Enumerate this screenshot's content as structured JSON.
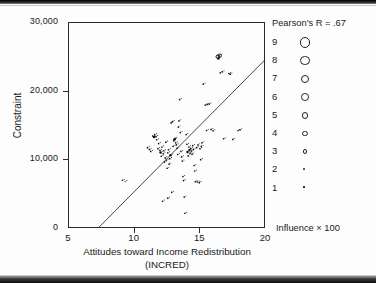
{
  "chart_data": {
    "type": "scatter",
    "title": "",
    "xlabel": "Attitudes toward Income Redistribution",
    "xlabel_line2": "(INCRED)",
    "ylabel": "Constraint",
    "xlim": [
      5,
      20
    ],
    "ylim": [
      0,
      30000
    ],
    "xticks": [
      5,
      10,
      15,
      20
    ],
    "xticklabels": [
      "5",
      "10",
      "15",
      "20"
    ],
    "yticks": [
      0,
      10000,
      20000,
      30000
    ],
    "yticklabels": [
      "0",
      "10,000",
      "20,000",
      "30,000"
    ],
    "grid": false,
    "annotation": "Pearson's R = .67",
    "correlation": 0.67,
    "legend_position": "right",
    "legend_title": "Influence × 100",
    "legend_entries": [
      {
        "label": "9",
        "size": 9
      },
      {
        "label": "8",
        "size": 8
      },
      {
        "label": "7",
        "size": 7
      },
      {
        "label": "6",
        "size": 6
      },
      {
        "label": "5",
        "size": 5
      },
      {
        "label": "4",
        "size": 4
      },
      {
        "label": "3",
        "size": 3
      },
      {
        "label": "2",
        "size": 2
      },
      {
        "label": "1",
        "size": 1
      }
    ],
    "regression_line": {
      "x": [
        7.3,
        20.0
      ],
      "y": [
        0,
        24500
      ]
    },
    "bubble_size_variable": "Influence × 100",
    "points": [
      {
        "x": 9.15,
        "y": 6950,
        "s": 2
      },
      {
        "x": 9.35,
        "y": 6750,
        "s": 1
      },
      {
        "x": 11.05,
        "y": 11700,
        "s": 2
      },
      {
        "x": 11.2,
        "y": 11450,
        "s": 2
      },
      {
        "x": 11.3,
        "y": 11150,
        "s": 2
      },
      {
        "x": 11.45,
        "y": 13400,
        "s": 2
      },
      {
        "x": 11.55,
        "y": 13250,
        "s": 3
      },
      {
        "x": 11.6,
        "y": 13600,
        "s": 2
      },
      {
        "x": 11.7,
        "y": 13300,
        "s": 2
      },
      {
        "x": 11.75,
        "y": 12850,
        "s": 2
      },
      {
        "x": 11.85,
        "y": 11550,
        "s": 2
      },
      {
        "x": 11.9,
        "y": 12300,
        "s": 2
      },
      {
        "x": 12.0,
        "y": 11300,
        "s": 2
      },
      {
        "x": 12.05,
        "y": 11000,
        "s": 3
      },
      {
        "x": 12.1,
        "y": 10450,
        "s": 2
      },
      {
        "x": 12.15,
        "y": 11800,
        "s": 2
      },
      {
        "x": 12.25,
        "y": 10800,
        "s": 2
      },
      {
        "x": 12.3,
        "y": 11250,
        "s": 2
      },
      {
        "x": 12.35,
        "y": 9600,
        "s": 2
      },
      {
        "x": 12.4,
        "y": 10200,
        "s": 2
      },
      {
        "x": 12.45,
        "y": 12500,
        "s": 2
      },
      {
        "x": 12.5,
        "y": 9900,
        "s": 2
      },
      {
        "x": 12.55,
        "y": 8700,
        "s": 2
      },
      {
        "x": 12.6,
        "y": 10950,
        "s": 2
      },
      {
        "x": 12.65,
        "y": 11400,
        "s": 2
      },
      {
        "x": 12.7,
        "y": 9300,
        "s": 2
      },
      {
        "x": 12.75,
        "y": 10100,
        "s": 2
      },
      {
        "x": 12.8,
        "y": 10600,
        "s": 3
      },
      {
        "x": 12.85,
        "y": 15300,
        "s": 2
      },
      {
        "x": 12.95,
        "y": 15500,
        "s": 2
      },
      {
        "x": 12.9,
        "y": 5200,
        "s": 2
      },
      {
        "x": 13.0,
        "y": 11900,
        "s": 2
      },
      {
        "x": 13.05,
        "y": 12700,
        "s": 2
      },
      {
        "x": 13.1,
        "y": 12900,
        "s": 3
      },
      {
        "x": 13.15,
        "y": 13050,
        "s": 2
      },
      {
        "x": 13.2,
        "y": 12400,
        "s": 2
      },
      {
        "x": 13.25,
        "y": 12100,
        "s": 2
      },
      {
        "x": 13.3,
        "y": 11600,
        "s": 2
      },
      {
        "x": 13.35,
        "y": 10700,
        "s": 2
      },
      {
        "x": 13.4,
        "y": 14700,
        "s": 2
      },
      {
        "x": 13.45,
        "y": 15600,
        "s": 2
      },
      {
        "x": 13.5,
        "y": 18700,
        "s": 2
      },
      {
        "x": 13.55,
        "y": 13900,
        "s": 2
      },
      {
        "x": 13.6,
        "y": 11150,
        "s": 2
      },
      {
        "x": 13.65,
        "y": 10350,
        "s": 2
      },
      {
        "x": 13.7,
        "y": 9750,
        "s": 2
      },
      {
        "x": 13.75,
        "y": 7500,
        "s": 2
      },
      {
        "x": 13.8,
        "y": 6900,
        "s": 2
      },
      {
        "x": 13.85,
        "y": 4500,
        "s": 2
      },
      {
        "x": 13.9,
        "y": 2150,
        "s": 2
      },
      {
        "x": 14.0,
        "y": 13600,
        "s": 2
      },
      {
        "x": 14.05,
        "y": 12200,
        "s": 2
      },
      {
        "x": 14.1,
        "y": 11050,
        "s": 3
      },
      {
        "x": 14.15,
        "y": 10500,
        "s": 2
      },
      {
        "x": 14.2,
        "y": 11800,
        "s": 2
      },
      {
        "x": 14.25,
        "y": 11350,
        "s": 3
      },
      {
        "x": 14.3,
        "y": 10900,
        "s": 2
      },
      {
        "x": 14.35,
        "y": 11600,
        "s": 2
      },
      {
        "x": 14.4,
        "y": 11200,
        "s": 2
      },
      {
        "x": 14.45,
        "y": 10750,
        "s": 2
      },
      {
        "x": 14.5,
        "y": 12000,
        "s": 2
      },
      {
        "x": 14.55,
        "y": 11450,
        "s": 2
      },
      {
        "x": 14.6,
        "y": 9100,
        "s": 2
      },
      {
        "x": 14.65,
        "y": 8300,
        "s": 2
      },
      {
        "x": 14.7,
        "y": 6750,
        "s": 2
      },
      {
        "x": 14.85,
        "y": 6700,
        "s": 2
      },
      {
        "x": 15.0,
        "y": 6600,
        "s": 2
      },
      {
        "x": 14.8,
        "y": 11700,
        "s": 2
      },
      {
        "x": 14.9,
        "y": 12100,
        "s": 2
      },
      {
        "x": 15.05,
        "y": 11550,
        "s": 2
      },
      {
        "x": 15.1,
        "y": 9950,
        "s": 2
      },
      {
        "x": 15.15,
        "y": 11900,
        "s": 2
      },
      {
        "x": 15.2,
        "y": 12400,
        "s": 2
      },
      {
        "x": 15.3,
        "y": 20950,
        "s": 2
      },
      {
        "x": 15.45,
        "y": 17900,
        "s": 2
      },
      {
        "x": 15.6,
        "y": 18000,
        "s": 2
      },
      {
        "x": 15.75,
        "y": 18050,
        "s": 2
      },
      {
        "x": 15.55,
        "y": 14200,
        "s": 2
      },
      {
        "x": 15.9,
        "y": 14350,
        "s": 2
      },
      {
        "x": 16.05,
        "y": 14150,
        "s": 2
      },
      {
        "x": 16.4,
        "y": 24950,
        "s": 4
      },
      {
        "x": 16.55,
        "y": 25100,
        "s": 4
      },
      {
        "x": 16.45,
        "y": 24700,
        "s": 3
      },
      {
        "x": 16.6,
        "y": 22600,
        "s": 2
      },
      {
        "x": 16.75,
        "y": 22750,
        "s": 2
      },
      {
        "x": 16.85,
        "y": 13000,
        "s": 2
      },
      {
        "x": 17.25,
        "y": 22500,
        "s": 2
      },
      {
        "x": 17.35,
        "y": 22400,
        "s": 2
      },
      {
        "x": 17.55,
        "y": 12900,
        "s": 2
      },
      {
        "x": 17.95,
        "y": 14200,
        "s": 2
      },
      {
        "x": 18.1,
        "y": 14300,
        "s": 2
      },
      {
        "x": 12.2,
        "y": 3900,
        "s": 2
      },
      {
        "x": 12.6,
        "y": 4350,
        "s": 2
      }
    ]
  }
}
